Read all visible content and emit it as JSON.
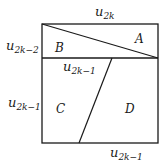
{
  "diagram": {
    "labels": {
      "top": {
        "base": "u",
        "sub": "2k"
      },
      "left_upper": {
        "base": "u",
        "sub": "2k−2"
      },
      "middle": {
        "base": "u",
        "sub": "2k−1"
      },
      "left_lower": {
        "base": "u",
        "sub": "2k−1"
      },
      "bottom": {
        "base": "u",
        "sub": "2k−1"
      }
    },
    "regions": {
      "A": "A",
      "B": "B",
      "C": "C",
      "D": "D"
    },
    "stroke_color": "#1a1a1a"
  }
}
